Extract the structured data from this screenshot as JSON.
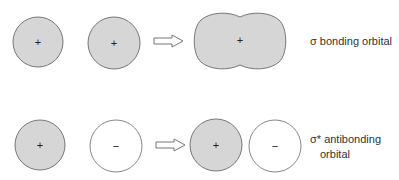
{
  "colors": {
    "filled": "#d6d6d6",
    "empty": "#ffffff",
    "stroke": "#777777",
    "text": "#333333"
  },
  "rows": [
    {
      "id": "bonding",
      "left_orbital_sign": "+",
      "right_orbital_sign": "+",
      "result_sign": "+",
      "label": "σ bonding orbital"
    },
    {
      "id": "antibonding",
      "left_orbital_sign": "+",
      "right_orbital_sign": "−",
      "result_left_sign": "+",
      "result_right_sign": "−",
      "label_line1": "σ* antibonding",
      "label_line2": "orbital"
    }
  ]
}
